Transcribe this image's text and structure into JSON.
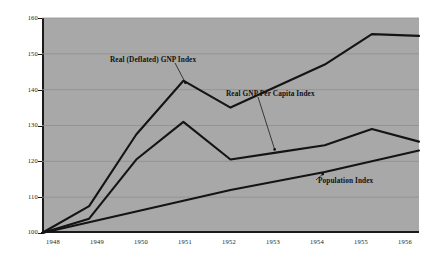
{
  "chart_data": {
    "type": "line",
    "title": "",
    "xlabel": "",
    "ylabel": "",
    "categories": [
      "1948",
      "1949",
      "1950",
      "1951",
      "1952",
      "1953",
      "1954",
      "1955",
      "1956"
    ],
    "x": [
      1948,
      1949,
      1950,
      1951,
      1952,
      1953,
      1954,
      1955,
      1956
    ],
    "ylim": [
      100,
      160
    ],
    "yticks": [
      100,
      110,
      120,
      130,
      140,
      150,
      160
    ],
    "grid": true,
    "legend_position": "inline-annotations",
    "plot_background_color": "#a8a8a8",
    "line_color": "#141414",
    "series": [
      {
        "name": "Real (Deflated) GNP Index",
        "values": [
          100,
          107.5,
          127.5,
          142.5,
          135,
          141,
          147,
          155.5,
          155
        ]
      },
      {
        "name": "Real GNP Per Capita Index",
        "values": [
          100,
          104,
          120.5,
          131,
          120.5,
          122.5,
          124.5,
          129,
          125.5
        ]
      },
      {
        "name": "Population Index",
        "values": [
          100,
          103,
          106,
          109,
          112,
          114.5,
          117,
          120,
          123
        ]
      }
    ],
    "annotations": [
      {
        "label": "Real (Deflated) GNP Index",
        "points_to_series": "Real (Deflated) GNP Index",
        "points_to_x": 1951
      },
      {
        "label": "Real GNP Per Capita Index",
        "points_to_series": "Real GNP Per Capita Index",
        "points_to_x": 1953
      },
      {
        "label": "Population Index",
        "points_to_series": "Population Index",
        "points_to_x": 1954
      }
    ]
  },
  "axis": {
    "y_tick_labels": [
      "160",
      "150",
      "140",
      "130",
      "120",
      "110",
      "100"
    ],
    "x_tick_labels": [
      "1948",
      "1949",
      "1950",
      "1951",
      "1952",
      "1953",
      "1954",
      "1955",
      "1956"
    ]
  },
  "annotations": {
    "gnp": "Real (Deflated) GNP Index",
    "per_capita": "Real GNP Per Capita Index",
    "population": "Population Index"
  }
}
